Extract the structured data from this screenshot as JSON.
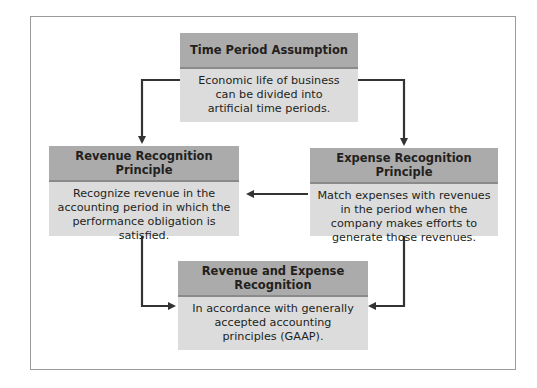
{
  "diagram": {
    "nodes": {
      "time_period": {
        "title": "Time Period Assumption",
        "body": "Economic life of business can be divided into artificial time periods."
      },
      "revenue_recognition": {
        "title": "Revenue Recognition Principle",
        "body": "Recognize revenue in the accounting period in which the performance obligation is satisfied."
      },
      "expense_recognition": {
        "title": "Expense Recognition Principle",
        "body": "Match expenses with revenues in the period when the company makes efforts to generate those revenues."
      },
      "revenue_expense": {
        "title": "Revenue and Expense Recognition",
        "body": "In accordance with generally accepted accounting principles (GAAP)."
      }
    },
    "edges": [
      {
        "from": "time_period",
        "to": "revenue_recognition"
      },
      {
        "from": "time_period",
        "to": "expense_recognition"
      },
      {
        "from": "expense_recognition",
        "to": "revenue_recognition"
      },
      {
        "from": "revenue_recognition",
        "to": "revenue_expense"
      },
      {
        "from": "expense_recognition",
        "to": "revenue_expense"
      }
    ],
    "colors": {
      "header_fill": "#ababab",
      "body_fill": "#dcdcdc",
      "arrow": "#333333",
      "frame": "#9a9a9a"
    }
  }
}
